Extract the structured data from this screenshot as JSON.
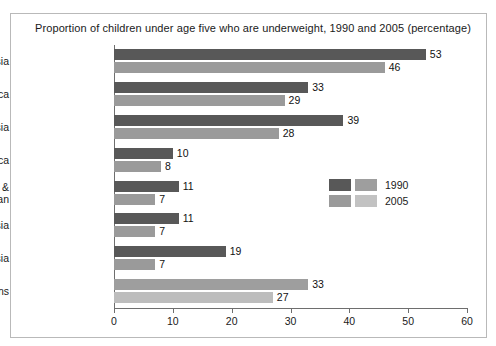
{
  "chart_data": {
    "type": "bar",
    "orientation": "horizontal",
    "title": "Proportion of children under age five who are underweight, 1990 and 2005 (percentage)",
    "xlabel": "",
    "ylabel": "",
    "xlim": [
      0,
      60
    ],
    "xticks": [
      "0",
      "10",
      "20",
      "30",
      "40",
      "50",
      "60"
    ],
    "grid": false,
    "legend_position": "center-right",
    "categories": [
      "Southern Asia",
      "Sub-Saharan Africa",
      "South-Eastern Asia",
      "Northern Africa",
      "Latin America & the Caribbean",
      "Western Asia",
      "Eastern Asia",
      "Developing regions"
    ],
    "category_lines": [
      [
        "Southern Asia"
      ],
      [
        "Sub-Saharan Africa"
      ],
      [
        "South-Eastern Asia"
      ],
      [
        "Northern Africa"
      ],
      [
        "Latin America &",
        "the Caribbean"
      ],
      [
        "Western Asia"
      ],
      [
        "Eastern Asia"
      ],
      [
        "Developing regions"
      ]
    ],
    "series": [
      {
        "name": "1990",
        "color": "#585858",
        "values": [
          53,
          33,
          39,
          10,
          11,
          11,
          19,
          33
        ],
        "labels": [
          "53",
          "33",
          "39",
          "10",
          "11",
          "11",
          "19",
          "33"
        ]
      },
      {
        "name": "2005",
        "color": "#9a9a9a",
        "values": [
          46,
          29,
          28,
          8,
          7,
          7,
          7,
          27
        ],
        "labels": [
          "46",
          "29",
          "28",
          "8",
          "7",
          "7",
          "7",
          "27"
        ]
      }
    ],
    "bar_colors_override": {
      "7": {
        "1990": "#9e9e9e",
        "2005": "#bdbdbd"
      }
    },
    "legend": [
      {
        "label": "1990",
        "swatch_left": "#585858",
        "swatch_right": "#9e9e9e"
      },
      {
        "label": "2005",
        "swatch_left": "#9a9a9a",
        "swatch_right": "#c2c2c2"
      }
    ]
  }
}
